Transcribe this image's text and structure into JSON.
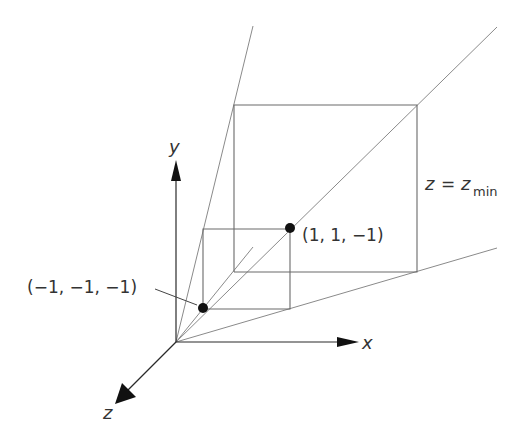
{
  "figure": {
    "axes": {
      "x_label": "x",
      "y_label": "y",
      "z_label": "z"
    },
    "points": [
      {
        "label": "(1, 1, −1)"
      },
      {
        "label": "(−1, −1, −1)"
      }
    ],
    "plane_label": {
      "lhs": "z",
      "eq": "=",
      "rhs": "z",
      "rhs_sub": "min"
    },
    "colors": {
      "line": "#6a6a6a",
      "ray": "#8a8a8a",
      "axis": "#2a2a2a",
      "text": "#333333"
    }
  }
}
